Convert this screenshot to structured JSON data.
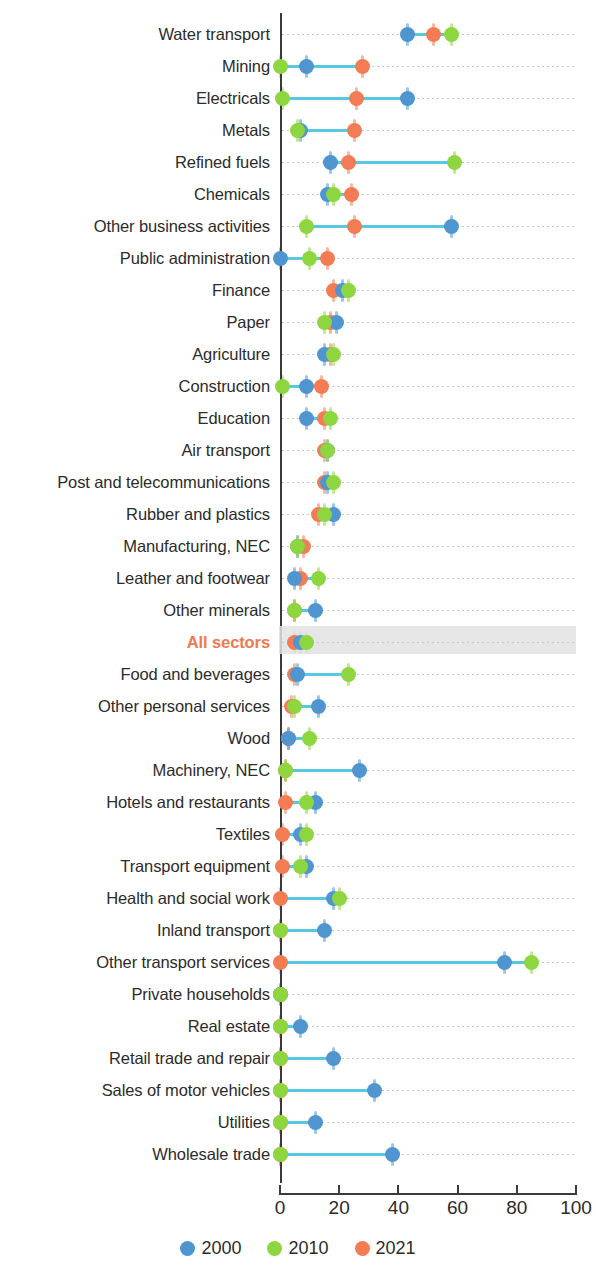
{
  "chart_data": {
    "type": "scatter",
    "title": "",
    "subtitle": "",
    "xlabel": "",
    "ylabel": "",
    "xlim": [
      0,
      100
    ],
    "xticks": [
      0,
      20,
      40,
      60,
      80,
      100
    ],
    "xtick_labels": [
      "0",
      "20",
      "40",
      "60",
      "80",
      "100"
    ],
    "grid": "horizontal-dotted",
    "legend_position": "bottom-center",
    "highlighted_category": "All sectors",
    "series": [
      {
        "name": "2000",
        "color": "#4f95cf"
      },
      {
        "name": "2010",
        "color": "#8ed63f"
      },
      {
        "name": "2021",
        "color": "#f37c54"
      }
    ],
    "categories": [
      "Water transport",
      "Mining",
      "Electricals",
      "Metals",
      "Refined fuels",
      "Chemicals",
      "Other business activities",
      "Public administration",
      "Finance",
      "Paper",
      "Agriculture",
      "Construction",
      "Education",
      "Air transport",
      "Post and telecommunications",
      "Rubber and plastics",
      "Manufacturing, NEC",
      "Leather and footwear",
      "Other minerals",
      "All sectors",
      "Food and beverages",
      "Other personal services",
      "Wood",
      "Machinery, NEC",
      "Hotels and restaurants",
      "Textiles",
      "Transport equipment",
      "Health and social work",
      "Inland transport",
      "Other transport services",
      "Private households",
      "Real estate",
      "Retail trade and repair",
      "Sales of motor vehicles",
      "Utilities",
      "Wholesale trade"
    ],
    "rows": [
      {
        "category": "Water transport",
        "v2000": 43,
        "v2010": 58,
        "v2021": 52
      },
      {
        "category": "Mining",
        "v2000": 9,
        "v2010": 0,
        "v2021": 28
      },
      {
        "category": "Electricals",
        "v2000": 43,
        "v2010": 1,
        "v2021": 26
      },
      {
        "category": "Metals",
        "v2000": 7,
        "v2010": 6,
        "v2021": 25
      },
      {
        "category": "Refined fuels",
        "v2000": 17,
        "v2010": 59,
        "v2021": 23
      },
      {
        "category": "Chemicals",
        "v2000": 16,
        "v2010": 18,
        "v2021": 24
      },
      {
        "category": "Other business activities",
        "v2000": 58,
        "v2010": 9,
        "v2021": 25
      },
      {
        "category": "Public administration",
        "v2000": 0,
        "v2010": 10,
        "v2021": 16
      },
      {
        "category": "Finance",
        "v2000": 21,
        "v2010": 23,
        "v2021": 18
      },
      {
        "category": "Paper",
        "v2000": 19,
        "v2010": 15,
        "v2021": 17
      },
      {
        "category": "Agriculture",
        "v2000": 15,
        "v2010": 18,
        "v2021": 17
      },
      {
        "category": "Construction",
        "v2000": 9,
        "v2010": 1,
        "v2021": 14
      },
      {
        "category": "Education",
        "v2000": 9,
        "v2010": 17,
        "v2021": 15
      },
      {
        "category": "Air transport",
        "v2000": 16,
        "v2010": 16,
        "v2021": 15
      },
      {
        "category": "Post and telecommunications",
        "v2000": 16,
        "v2010": 18,
        "v2021": 15
      },
      {
        "category": "Rubber and plastics",
        "v2000": 18,
        "v2010": 15,
        "v2021": 13
      },
      {
        "category": "Manufacturing, NEC",
        "v2000": 6,
        "v2010": 6,
        "v2021": 8
      },
      {
        "category": "Leather and footwear",
        "v2000": 5,
        "v2010": 13,
        "v2021": 7
      },
      {
        "category": "Other minerals",
        "v2000": 12,
        "v2010": 5,
        "v2021": 5
      },
      {
        "category": "All sectors",
        "v2000": 7,
        "v2010": 9,
        "v2021": 5
      },
      {
        "category": "Food and beverages",
        "v2000": 6,
        "v2010": 23,
        "v2021": 5
      },
      {
        "category": "Other personal services",
        "v2000": 13,
        "v2010": 5,
        "v2021": 4
      },
      {
        "category": "Wood",
        "v2000": 3,
        "v2010": 10,
        "v2021": 3
      },
      {
        "category": "Machinery, NEC",
        "v2000": 27,
        "v2010": 2,
        "v2021": 2
      },
      {
        "category": "Hotels and restaurants",
        "v2000": 12,
        "v2010": 9,
        "v2021": 2
      },
      {
        "category": "Textiles",
        "v2000": 7,
        "v2010": 9,
        "v2021": 1
      },
      {
        "category": "Transport equipment",
        "v2000": 9,
        "v2010": 7,
        "v2021": 1
      },
      {
        "category": "Health and social work",
        "v2000": 18,
        "v2010": 20,
        "v2021": 0
      },
      {
        "category": "Inland transport",
        "v2000": 15,
        "v2010": 0,
        "v2021": 0
      },
      {
        "category": "Other transport services",
        "v2000": 76,
        "v2010": 85,
        "v2021": 0
      },
      {
        "category": "Private households",
        "v2000": 0,
        "v2010": 0,
        "v2021": 0
      },
      {
        "category": "Real estate",
        "v2000": 7,
        "v2010": 0,
        "v2021": 0
      },
      {
        "category": "Retail trade and repair",
        "v2000": 18,
        "v2010": 0,
        "v2021": 0
      },
      {
        "category": "Sales of motor vehicles",
        "v2000": 32,
        "v2010": 0,
        "v2021": 0
      },
      {
        "category": "Utilities",
        "v2000": 12,
        "v2010": 0,
        "v2021": 0
      },
      {
        "category": "Wholesale trade",
        "v2000": 38,
        "v2010": 0,
        "v2021": 0
      }
    ]
  },
  "legend": {
    "items": [
      {
        "label": "2000",
        "color": "#4f95cf"
      },
      {
        "label": "2010",
        "color": "#8ed63f"
      },
      {
        "label": "2021",
        "color": "#f37c54"
      }
    ]
  },
  "axis": {
    "ticks": [
      "0",
      "20",
      "40",
      "60",
      "80",
      "100"
    ]
  }
}
